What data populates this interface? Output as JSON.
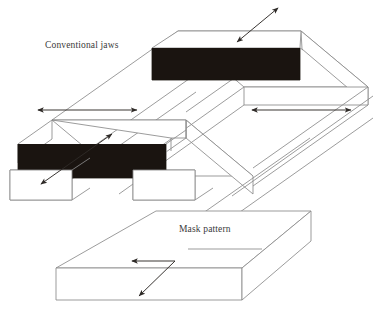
{
  "figure": {
    "kind": "isometric-technical-diagram",
    "background_color": "#ffffff",
    "line_color": "#8a8a8a",
    "arrow_color": "#3a3a3a",
    "solid_block_color": "#1a1410",
    "width": 373,
    "height": 321
  },
  "labels": {
    "conventional_jaws": "Conventional jaws",
    "mask_pattern": "Mask pattern"
  },
  "parts": {
    "top_jaw": {
      "name": "upper conventional jaw",
      "fill": "#1a1410"
    },
    "lower_jaw": {
      "name": "lower conventional jaw",
      "fill": "#1a1410"
    },
    "rail_far": {
      "name": "far rail",
      "fill": "#ffffff"
    },
    "rail_near": {
      "name": "near rail",
      "fill": "#ffffff"
    },
    "mask_slab": {
      "name": "mask pattern slab",
      "fill": "#ffffff"
    }
  },
  "arrows": {
    "top_diagonal": {
      "name": "top diagonal double arrow",
      "heads": "both"
    },
    "left_horizontal": {
      "name": "left horizontal double arrow",
      "heads": "both"
    },
    "right_horizontal": {
      "name": "right horizontal double arrow",
      "heads": "both"
    },
    "jaw_diagonal": {
      "name": "lower jaw diagonal double arrow",
      "heads": "both"
    },
    "mask_bent": {
      "name": "mask pattern bent arrow",
      "heads": "both"
    }
  }
}
